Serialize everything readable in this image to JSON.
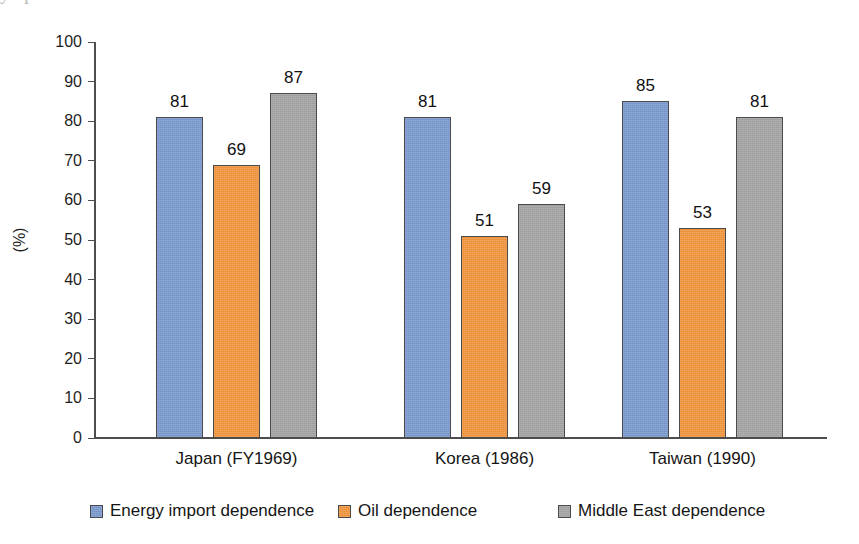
{
  "top_bleed_text": "y   t   p   o   f",
  "chart_data": {
    "type": "bar",
    "title": "",
    "xlabel": "",
    "ylabel": "(%)",
    "ylim": [
      0,
      100
    ],
    "ytick_step": 10,
    "yticks": [
      "100",
      "90",
      "80",
      "70",
      "60",
      "50",
      "40",
      "30",
      "20",
      "10",
      "0"
    ],
    "grid": false,
    "legend_position": "bottom",
    "categories": [
      "Japan (FY1969)",
      "Korea (1986)",
      "Taiwan (1990)"
    ],
    "series": [
      {
        "name": "Energy import dependence",
        "color": "#6f90c8",
        "values": [
          81,
          81,
          85
        ],
        "labels": [
          "81",
          "81",
          "85"
        ]
      },
      {
        "name": "Oil dependence",
        "color": "#ec8b2e",
        "values": [
          69,
          51,
          53
        ],
        "labels": [
          "69",
          "51",
          "53"
        ]
      },
      {
        "name": "Middle East dependence",
        "color": "#9a9a9a",
        "values": [
          87,
          59,
          81
        ],
        "labels": [
          "87",
          "59",
          "81"
        ]
      }
    ]
  },
  "axis": {
    "y_title": "(%)",
    "axis_color": "#4d4d4d"
  },
  "legend": {
    "items": [
      {
        "label": "Energy import dependence",
        "color": "#6f90c8"
      },
      {
        "label": "Oil dependence",
        "color": "#ec8b2e"
      },
      {
        "label": "Middle East dependence",
        "color": "#9a9a9a"
      }
    ]
  }
}
